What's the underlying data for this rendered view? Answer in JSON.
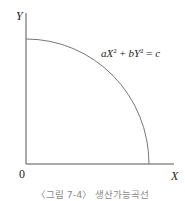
{
  "diagram": {
    "y_axis_label": "Y",
    "x_axis_label": "X",
    "origin_label": "0",
    "equation": {
      "a": "a",
      "X": "X",
      "exp1": "2",
      "plus": " + ",
      "b": "b",
      "Y": "Y",
      "exp2": "2",
      "eq": " = ",
      "c": "c"
    },
    "caption": "〈그림 7-4〉 생산가능곡선",
    "colors": {
      "axis": "#555555",
      "curve": "#777777",
      "text": "#222222",
      "caption": "#8a8a8a"
    }
  }
}
